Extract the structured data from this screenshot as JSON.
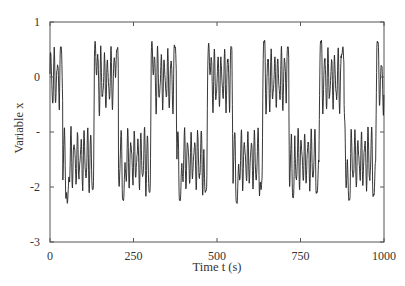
{
  "chart_data": {
    "type": "line",
    "title": "",
    "xlabel": "Time t (s)",
    "ylabel": "Variable x",
    "xlim": [
      0,
      1000
    ],
    "ylim": [
      -3,
      1
    ],
    "grid": false,
    "legend": null,
    "x_ticks": [
      {
        "value": 0,
        "label": "0"
      },
      {
        "value": 250,
        "label": "250"
      },
      {
        "value": 500,
        "label": "500"
      },
      {
        "value": 750,
        "label": "750"
      },
      {
        "value": 1000,
        "label": "1000"
      }
    ],
    "y_ticks": [
      {
        "value": 1,
        "label": "1"
      },
      {
        "value": 0,
        "label": "0"
      },
      {
        "value": -1,
        "label": "-"
      },
      {
        "value": -2,
        "label": "-2"
      },
      {
        "value": -3,
        "label": "-3"
      }
    ],
    "series": [
      {
        "name": "x(t)",
        "color": "#222222",
        "description": "Bistable switching between upper state (~0, range -0.8..0.65) and lower state (~-1.5, range -2.3..-0.8) with fast superimposed oscillations; switching period ~170 s",
        "upper_intervals": [
          [
            0,
            38
          ],
          [
            135,
            205
          ],
          [
            305,
            378
          ],
          [
            475,
            545
          ],
          [
            640,
            715
          ],
          [
            810,
            880
          ],
          [
            978,
            1000
          ]
        ],
        "lower_intervals": [
          [
            38,
            135
          ],
          [
            205,
            305
          ],
          [
            378,
            475
          ],
          [
            545,
            640
          ],
          [
            715,
            810
          ],
          [
            880,
            978
          ]
        ],
        "overshoot_peaks": [
          {
            "t": 33,
            "x": 0.55
          },
          {
            "t": 135,
            "x": 0.65
          },
          {
            "t": 200,
            "x": 0.5
          },
          {
            "t": 305,
            "x": 0.65
          },
          {
            "t": 375,
            "x": 0.55
          },
          {
            "t": 475,
            "x": 0.62
          },
          {
            "t": 543,
            "x": 0.55
          },
          {
            "t": 640,
            "x": 0.65
          },
          {
            "t": 712,
            "x": 0.55
          },
          {
            "t": 810,
            "x": 0.65
          },
          {
            "t": 877,
            "x": 0.55
          },
          {
            "t": 980,
            "x": 0.65
          }
        ],
        "undershoot_dips": [
          {
            "t": 52,
            "x": -2.3
          },
          {
            "t": 128,
            "x": -2.05
          },
          {
            "t": 220,
            "x": -2.25
          },
          {
            "t": 298,
            "x": -2.1
          },
          {
            "t": 390,
            "x": -2.25
          },
          {
            "t": 465,
            "x": -2.1
          },
          {
            "t": 560,
            "x": -2.3
          },
          {
            "t": 632,
            "x": -2.05
          },
          {
            "t": 728,
            "x": -2.2
          },
          {
            "t": 800,
            "x": -2.1
          },
          {
            "t": 895,
            "x": -2.25
          },
          {
            "t": 970,
            "x": -2.15
          }
        ],
        "fast_oscillation_period_s": 10,
        "upper_mean": -0.05,
        "lower_mean": -1.5
      }
    ]
  },
  "colors": {
    "line": "#222222",
    "axis": "#555555",
    "text": "#333333",
    "background": "#ffffff"
  }
}
